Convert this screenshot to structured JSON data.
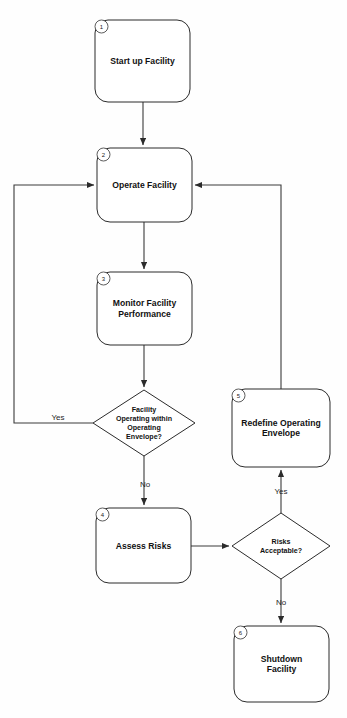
{
  "diagram": {
    "background_color": "#fefefe",
    "line_color": "#3a3a3a",
    "shape_fill": "#ffffff",
    "shape_stroke": "#2b2b2b"
  },
  "nodes": [
    {
      "id": "n1",
      "number": "1",
      "shape": "rounded-rectangle",
      "lines": [
        "Start up Facility"
      ],
      "x": 95,
      "y": 20,
      "w": 95,
      "h": 82
    },
    {
      "id": "n2",
      "number": "2",
      "shape": "rounded-rectangle",
      "lines": [
        "Operate Facility"
      ],
      "x": 97,
      "y": 148,
      "w": 95,
      "h": 74
    },
    {
      "id": "n3",
      "number": "3",
      "shape": "rounded-rectangle",
      "lines": [
        "Monitor Facility",
        "Performance"
      ],
      "x": 97,
      "y": 272,
      "w": 95,
      "h": 73
    },
    {
      "id": "n4",
      "number": "4",
      "shape": "rounded-rectangle",
      "lines": [
        "Assess Risks"
      ],
      "x": 96,
      "y": 508,
      "w": 95,
      "h": 75
    },
    {
      "id": "n5",
      "number": "5",
      "shape": "rounded-rectangle",
      "lines": [
        "Redefine Operating",
        "Envelope"
      ],
      "x": 232,
      "y": 389,
      "w": 98,
      "h": 78
    },
    {
      "id": "n6",
      "number": "6",
      "shape": "rounded-rectangle",
      "lines": [
        "Shutdown",
        "Facility"
      ],
      "x": 234,
      "y": 626,
      "w": 95,
      "h": 76
    }
  ],
  "decisions": [
    {
      "id": "d1",
      "shape": "diamond",
      "lines": [
        "Facility",
        "Operating within",
        "Operating",
        "Envelope?"
      ],
      "cx": 144,
      "cy": 423,
      "rx": 51,
      "ry": 33
    },
    {
      "id": "d2",
      "shape": "diamond",
      "lines": [
        "Risks",
        "Acceptable?"
      ],
      "cx": 281,
      "cy": 546,
      "rx": 49,
      "ry": 33
    }
  ],
  "edges": [
    {
      "id": "e1",
      "from": "n1",
      "to": "n2",
      "label": "",
      "path": "M 143 102 L 143 145"
    },
    {
      "id": "e2",
      "from": "n2",
      "to": "n3",
      "label": "",
      "path": "M 144 222 L 144 269"
    },
    {
      "id": "e3",
      "from": "n3",
      "to": "d1",
      "label": "",
      "path": "M 144 345 L 144 387"
    },
    {
      "id": "e4",
      "from": "d1",
      "to": "n2",
      "label": "Yes",
      "label_x": 58,
      "label_y": 420,
      "path": "M 93 423 L 14 423 L 14 185 L 94 185"
    },
    {
      "id": "e5",
      "from": "d1",
      "to": "n4",
      "label": "No",
      "label_x": 145,
      "label_y": 487,
      "path": "M 144 456 L 144 505"
    },
    {
      "id": "e6",
      "from": "n4",
      "to": "d2",
      "label": "",
      "path": "M 191 546 L 229 546"
    },
    {
      "id": "e7",
      "from": "d2",
      "to": "n5",
      "label": "Yes",
      "label_x": 281,
      "label_y": 494,
      "path": "M 281 513 L 281 470"
    },
    {
      "id": "e8",
      "from": "n5",
      "to": "n2",
      "label": "",
      "path": "M 281 389 L 281 185 L 195 185"
    },
    {
      "id": "e9",
      "from": "d2",
      "to": "n6",
      "label": "No",
      "label_x": 281,
      "label_y": 605,
      "path": "M 281 579 L 281 623"
    }
  ],
  "chart_data": {
    "type": "diagram",
    "node_labels": [
      "Start up Facility",
      "Operate Facility",
      "Monitor Facility Performance",
      "Assess Risks",
      "Redefine Operating Envelope",
      "Shutdown Facility"
    ],
    "decision_labels": [
      "Facility Operating within Operating Envelope?",
      "Risks Acceptable?"
    ],
    "edge_labels": [
      "Yes",
      "No",
      "Yes",
      "No"
    ]
  }
}
